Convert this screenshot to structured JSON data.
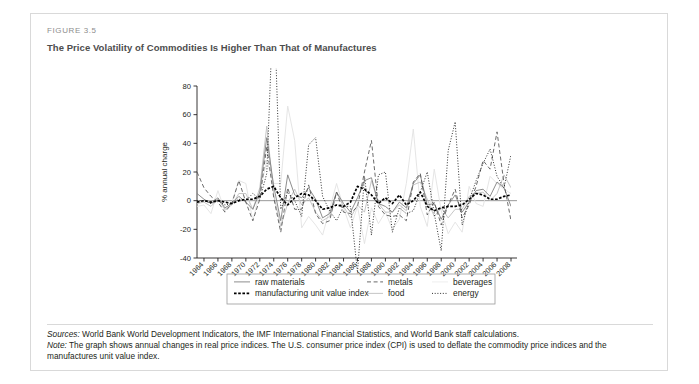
{
  "figure": {
    "label": "FIGURE 3.5",
    "title": "The Price Volatility of Commodities Is Higher Than That of Manufactures"
  },
  "notes": {
    "sources_label": "Sources:",
    "sources_text": " World Bank World Development Indicators, the IMF International Financial Statistics, and World Bank staff calculations.",
    "note_label": "Note:",
    "note_text": " The graph shows annual changes in real price indices. The U.S. consumer price index (CPI) is used to deflate the commodity price indices and the manufactures unit value index."
  },
  "chart_data": {
    "type": "line",
    "title": "The Price Volatility of Commodities Is Higher Than That of Manufactures",
    "xlabel": "",
    "ylabel": "% annual charge",
    "ylim": [
      -40,
      80
    ],
    "yticks": [
      80,
      60,
      40,
      20,
      0,
      -20,
      -40
    ],
    "ytick_labels": [
      "80",
      "60",
      "40",
      "20",
      "0",
      "-20",
      "-40"
    ],
    "xlim": [
      1963,
      2008
    ],
    "xticks": [
      1964,
      1966,
      1968,
      1970,
      1972,
      1974,
      1976,
      1978,
      1980,
      1982,
      1984,
      1986,
      1988,
      1990,
      1992,
      1994,
      1996,
      1998,
      2000,
      2002,
      2004,
      2006,
      2008
    ],
    "xtick_labels": [
      "1964",
      "1966",
      "1968",
      "1970",
      "1972",
      "1974",
      "1976",
      "1978",
      "1980",
      "1982",
      "1984",
      "1986",
      "1988",
      "1990",
      "1992",
      "1994",
      "1996",
      "1998",
      "2000",
      "2002",
      "2004",
      "2006",
      "2008"
    ],
    "x": [
      1963,
      1964,
      1965,
      1966,
      1967,
      1968,
      1969,
      1970,
      1971,
      1972,
      1973,
      1974,
      1975,
      1976,
      1977,
      1978,
      1979,
      1980,
      1981,
      1982,
      1983,
      1984,
      1985,
      1986,
      1987,
      1988,
      1989,
      1990,
      1991,
      1992,
      1993,
      1994,
      1995,
      1996,
      1997,
      1998,
      1999,
      2000,
      2001,
      2002,
      2003,
      2004,
      2005,
      2006,
      2007,
      2008
    ],
    "grid": false,
    "zero_line": true,
    "legend_position": "below",
    "series": [
      {
        "name": "raw materials",
        "style": "solid",
        "color": "#808080",
        "width": 0.9,
        "values": [
          5,
          1,
          -2,
          2,
          -5,
          -2,
          3,
          -1,
          -6,
          6,
          44,
          10,
          -14,
          18,
          4,
          2,
          9,
          1,
          -12,
          -9,
          6,
          -2,
          -8,
          2,
          14,
          16,
          -2,
          -4,
          -8,
          -1,
          -5,
          12,
          18,
          -3,
          -2,
          -13,
          -3,
          4,
          -8,
          -1,
          7,
          8,
          3,
          13,
          9,
          -4
        ]
      },
      {
        "name": "metals",
        "style": "dashed",
        "color": "#595959",
        "width": 0.9,
        "values": [
          20,
          9,
          3,
          -1,
          -8,
          -2,
          14,
          -1,
          -14,
          1,
          38,
          2,
          -22,
          9,
          -6,
          -6,
          11,
          -9,
          -16,
          -14,
          6,
          -8,
          -9,
          -4,
          20,
          42,
          -4,
          -10,
          -11,
          -10,
          -14,
          13,
          19,
          -10,
          -1,
          -17,
          -3,
          8,
          -12,
          -3,
          10,
          28,
          22,
          48,
          12,
          -14
        ]
      },
      {
        "name": "beverages",
        "style": "solid",
        "color": "#e2e2e2",
        "width": 0.9,
        "values": [
          -4,
          -3,
          -9,
          7,
          -7,
          -1,
          14,
          12,
          -14,
          6,
          28,
          12,
          12,
          66,
          42,
          -19,
          -11,
          -17,
          -24,
          -6,
          12,
          -5,
          -19,
          -4,
          -30,
          -5,
          -16,
          -8,
          -20,
          -13,
          12,
          50,
          -4,
          -18,
          22,
          -7,
          -23,
          -15,
          -22,
          10,
          -2,
          -4,
          17,
          12,
          8,
          5
        ]
      },
      {
        "name": "food",
        "style": "solid",
        "color": "#bfbfbf",
        "width": 0.9,
        "values": [
          -2,
          -1,
          -4,
          1,
          -6,
          -3,
          5,
          5,
          -6,
          9,
          52,
          4,
          -18,
          -2,
          8,
          -3,
          2,
          -8,
          -14,
          -11,
          6,
          -4,
          -12,
          -3,
          -8,
          14,
          -2,
          -8,
          -8,
          -3,
          -7,
          11,
          13,
          1,
          -11,
          -5,
          -12,
          -6,
          -6,
          3,
          5,
          6,
          0,
          5,
          18,
          9
        ]
      },
      {
        "name": "energy",
        "style": "dotted",
        "color": "#1a1a1a",
        "width": 0.9,
        "values": [
          0,
          0,
          -2,
          0,
          -3,
          -2,
          1,
          0,
          5,
          1,
          19,
          146,
          -6,
          6,
          0,
          -11,
          39,
          44,
          3,
          -7,
          -14,
          -4,
          -4,
          -50,
          17,
          -24,
          18,
          20,
          -22,
          -5,
          -9,
          -7,
          6,
          20,
          -9,
          -35,
          35,
          55,
          -17,
          0,
          14,
          26,
          36,
          17,
          9,
          32
        ]
      },
      {
        "name": "manufacturing unit value index",
        "style": "thick-dashed",
        "color": "#000000",
        "width": 1.7,
        "values": [
          -1,
          0,
          -1,
          0,
          -1,
          -2,
          0,
          1,
          1,
          3,
          8,
          10,
          2,
          -3,
          2,
          5,
          4,
          0,
          -6,
          -5,
          -3,
          -4,
          -1,
          10,
          8,
          4,
          -2,
          2,
          -2,
          4,
          -3,
          0,
          6,
          -4,
          -7,
          -5,
          -4,
          -4,
          -3,
          1,
          5,
          4,
          1,
          1,
          3,
          4
        ]
      }
    ],
    "legend": [
      {
        "label": "raw materials",
        "style": "solid",
        "color": "#808080",
        "col": 0,
        "row": 0
      },
      {
        "label": "manufacturing unit value index",
        "style": "thick-dashed",
        "color": "#000000",
        "col": 0,
        "row": 1
      },
      {
        "label": "metals",
        "style": "dashed",
        "color": "#595959",
        "col": 1,
        "row": 0
      },
      {
        "label": "food",
        "style": "solid",
        "color": "#bfbfbf",
        "col": 1,
        "row": 1
      },
      {
        "label": "beverages",
        "style": "solid",
        "color": "#ececec",
        "col": 2,
        "row": 0
      },
      {
        "label": "energy",
        "style": "dotted",
        "color": "#1a1a1a",
        "col": 2,
        "row": 1
      }
    ]
  }
}
